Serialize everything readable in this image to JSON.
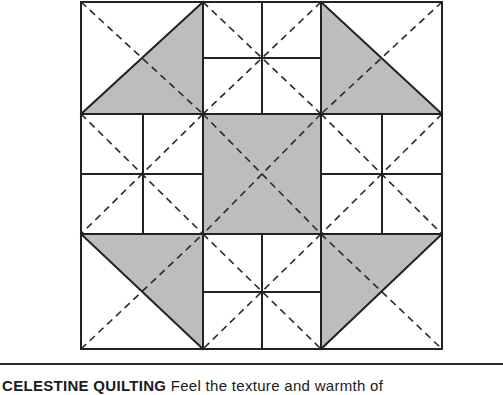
{
  "figure": {
    "type": "quilt-block-diagram",
    "colors": {
      "outline": "#222222",
      "shade": "#bdbdbd",
      "background": "#ffffff",
      "dash": "#2a2a2a"
    },
    "grid": {
      "left": 81,
      "top": 2,
      "right": 442,
      "bottom": 349,
      "cols": [
        81,
        203,
        321,
        442
      ],
      "rows": [
        2,
        114,
        234,
        349
      ]
    },
    "cells": [
      {
        "pos": "top-left",
        "kind": "half-square-triangle",
        "shaded": "lower-right"
      },
      {
        "pos": "top-center",
        "kind": "four-patch"
      },
      {
        "pos": "top-right",
        "kind": "half-square-triangle",
        "shaded": "lower-left"
      },
      {
        "pos": "middle-left",
        "kind": "four-patch"
      },
      {
        "pos": "center",
        "kind": "solid-square",
        "shaded": "all"
      },
      {
        "pos": "middle-right",
        "kind": "four-patch"
      },
      {
        "pos": "bottom-left",
        "kind": "half-square-triangle",
        "shaded": "upper-right"
      },
      {
        "pos": "bottom-center",
        "kind": "four-patch"
      },
      {
        "pos": "bottom-right",
        "kind": "half-square-triangle",
        "shaded": "upper-left"
      }
    ]
  },
  "caption": {
    "title": "CELESTINE QUILTING",
    "rest": " Feel the texture and warmth of"
  }
}
